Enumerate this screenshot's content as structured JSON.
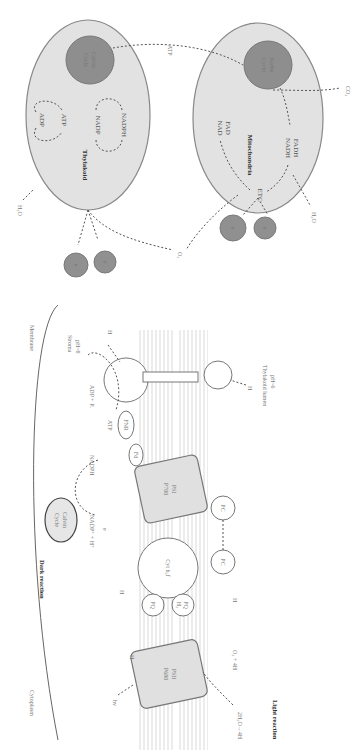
{
  "figure": {
    "orientation": "rotated 90 degrees clockwise",
    "top_panel": {
      "thylakoid": {
        "label": "Thylakoid",
        "calvin_cycle": "Calvin Cycle",
        "calvin_line1": "Calvin",
        "calvin_line2": "Cycle",
        "adp": "ADP",
        "atp": "ATP",
        "nadp": "NADP",
        "nadph": "NADPH",
        "h2o_in": "H₂O",
        "outputs": [
          "e",
          "e"
        ]
      },
      "mitochondria": {
        "label": "Mitochondria",
        "krebs_line1": "Krebs",
        "krebs_line2": "Cycle",
        "nad": "NAD",
        "fad": "FAD",
        "nadh": "NADH",
        "fadh": "FADH",
        "etc": "ETC",
        "co2_out": "CO₂",
        "h2o_out": "H₂O",
        "outputs": [
          "e",
          "e"
        ]
      },
      "atp_transfer": "ATP",
      "o2": "O₂"
    },
    "bottom_panel": {
      "cytoplasm": "Cytoplasm",
      "membrane": "Membrane",
      "dark_reaction": "Dark reaction",
      "light_reaction": "Light reaction",
      "calvin_line1": "Calvin",
      "calvin_line2": "Cycle",
      "nadp_h": "NADP⁺ + H⁺",
      "nadph": "NADPH",
      "adp_pi": "ADP + Pᵢ",
      "atp": "ATP",
      "stroma_line1": "Stroma",
      "stroma_line2": "pH~8",
      "lumen_line1": "Thylakoid lumen",
      "lumen_line2": "pH~6",
      "psii_line1": "PSII",
      "psii_line2": "P680",
      "psi_line1": "PSI",
      "psi_line2": "P700",
      "cytb6f_line1": "Cyt b₆f",
      "pq": "PQ",
      "pqh2_line1": "PQ",
      "pqh2_line2": "H₂",
      "pc": "PC",
      "fd": "Fd",
      "fnr": "FNR",
      "water_split": "2H₂O→4H",
      "o2_4h": "O₂ + 4H",
      "h": "H",
      "light": "hν",
      "e": "e"
    }
  }
}
